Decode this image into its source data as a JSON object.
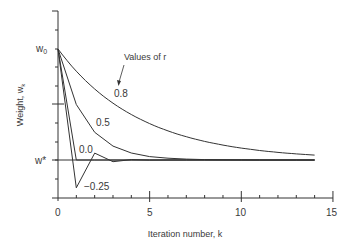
{
  "chart_data": {
    "type": "line",
    "title": "",
    "xlabel": "Iteration number, k",
    "ylabel": "Weight, w",
    "ylabel_subscript": "k",
    "xlim": [
      0,
      15
    ],
    "x_ticks": [
      0,
      5,
      10,
      15
    ],
    "x_tick_labels": [
      "0",
      "5",
      "10",
      "15"
    ],
    "y_tick_labels": {
      "w0": "w",
      "w0_sub": "0",
      "wstar": "w*"
    },
    "annotation": "Values of r",
    "grid": false,
    "legend": "none (inline curve labels)",
    "normalized_y_note": "y expressed as (w_k - w*)/(w_0 - w*); w0 = 1, w* = 0",
    "x": [
      0,
      1,
      2,
      3,
      4,
      5,
      6,
      7,
      8,
      9,
      10,
      11,
      12,
      13,
      14
    ],
    "series": [
      {
        "name": "0.8",
        "label": "0.8",
        "values": [
          1,
          0.8,
          0.64,
          0.512,
          0.41,
          0.328,
          0.262,
          0.21,
          0.168,
          0.134,
          0.107,
          0.086,
          0.069,
          0.055,
          0.044
        ]
      },
      {
        "name": "0.5",
        "label": "0.5",
        "values": [
          1,
          0.5,
          0.25,
          0.125,
          0.063,
          0.031,
          0.016,
          0.008,
          0.004,
          0.002,
          0.001,
          0,
          0,
          0,
          0
        ]
      },
      {
        "name": "0.0",
        "label": "0.0",
        "values": [
          1,
          0,
          0,
          0,
          0,
          0,
          0,
          0,
          0,
          0,
          0,
          0,
          0,
          0,
          0
        ]
      },
      {
        "name": "-0.25",
        "label": "−0.25",
        "values": [
          1,
          -0.25,
          0.0625,
          -0.0156,
          0.0039,
          -0.001,
          0,
          0,
          0,
          0,
          0,
          0,
          0,
          0,
          0
        ]
      }
    ]
  }
}
